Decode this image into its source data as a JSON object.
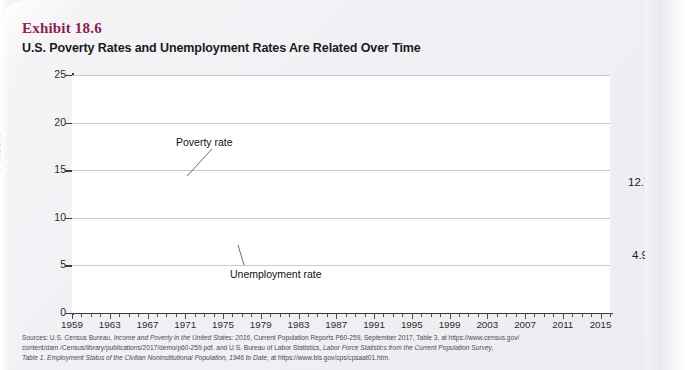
{
  "exhibit": {
    "number": "Exhibit 18.6",
    "title": "U.S. Poverty Rates and Unemployment Rates Are Related Over Time"
  },
  "colors": {
    "poverty_line": "#3b3784",
    "unemployment_line": "#e0201f",
    "exhibit_number": "#8b2252",
    "axis": "#3a3a3a",
    "grid": "#c9c9d2",
    "plot_background": "#ffffff"
  },
  "annotations": {
    "poverty_label": "Poverty rate",
    "unemployment_label": "Unemployment  rate",
    "poverty_end_value": "12.7%",
    "unemployment_end_value": "4.9%"
  },
  "sources": {
    "line1_prefix": "Sources: U.S. Census Bureau, ",
    "line1_italic": "Income and Poverty in the United States: 2016",
    "line1_suffix": ", Current Population Reports P60-259, September 2017, Table 3, at https://www.census.gov/",
    "line2": "content/dam /Census/library/publications/2017/demo/p60-259.pdf. and U.S. Bureau of Labor Statistics, ",
    "line2_italic": "Labor Force Statistics from the Current Population Survey,",
    "line3_italic": "Table 1. Employment Status of the Civilian Noninstitutional Population, 1946 to Date",
    "line3_suffix": ", at https://www.bls.gov/cps/cpsaat01.htm."
  },
  "chart_data": {
    "type": "line",
    "title": "U.S. Poverty Rates and Unemployment Rates Are Related Over Time",
    "xlabel": "",
    "ylabel": "Percent",
    "ylim": [
      0,
      25
    ],
    "yticks": [
      0,
      5,
      10,
      15,
      20,
      25
    ],
    "xlim": [
      1959,
      2016
    ],
    "xticks_labeled": [
      1959,
      1963,
      1967,
      1971,
      1975,
      1979,
      1983,
      1987,
      1991,
      1995,
      1999,
      2003,
      2007,
      2011,
      2015
    ],
    "xtick_interval_minor": 1,
    "grid": "horizontal",
    "legend_position": "inline-annotations",
    "x": [
      1959,
      1960,
      1961,
      1962,
      1963,
      1964,
      1965,
      1966,
      1967,
      1968,
      1969,
      1970,
      1971,
      1972,
      1973,
      1974,
      1975,
      1976,
      1977,
      1978,
      1979,
      1980,
      1981,
      1982,
      1983,
      1984,
      1985,
      1986,
      1987,
      1988,
      1989,
      1990,
      1991,
      1992,
      1993,
      1994,
      1995,
      1996,
      1997,
      1998,
      1999,
      2000,
      2001,
      2002,
      2003,
      2004,
      2005,
      2006,
      2007,
      2008,
      2009,
      2010,
      2011,
      2012,
      2013,
      2014,
      2015,
      2016
    ],
    "series": [
      {
        "name": "Poverty rate",
        "color": "#3b3784",
        "end_label": "12.7%",
        "values": [
          22.4,
          22.2,
          21.9,
          21.0,
          19.5,
          19.0,
          17.3,
          14.7,
          14.2,
          12.8,
          12.1,
          12.6,
          12.5,
          11.9,
          11.1,
          11.2,
          12.3,
          11.8,
          11.6,
          11.4,
          11.7,
          13.0,
          14.0,
          15.0,
          15.2,
          14.4,
          14.0,
          13.6,
          13.4,
          13.0,
          12.8,
          13.5,
          14.2,
          14.8,
          15.1,
          14.5,
          13.8,
          13.7,
          13.3,
          12.7,
          11.9,
          11.3,
          11.7,
          12.1,
          12.5,
          12.7,
          12.6,
          12.3,
          12.5,
          13.2,
          14.3,
          15.1,
          15.0,
          15.0,
          14.8,
          14.8,
          13.5,
          12.7
        ]
      },
      {
        "name": "Unemployment rate",
        "color": "#e0201f",
        "end_label": "4.9%",
        "values": [
          5.5,
          5.5,
          6.7,
          5.5,
          5.7,
          5.2,
          4.5,
          3.8,
          3.8,
          3.6,
          3.5,
          4.9,
          5.9,
          5.6,
          4.9,
          5.6,
          8.5,
          7.7,
          7.1,
          6.1,
          5.8,
          7.1,
          7.6,
          9.7,
          9.6,
          7.5,
          7.2,
          7.0,
          6.2,
          5.5,
          5.3,
          5.6,
          6.8,
          7.5,
          6.9,
          6.1,
          5.6,
          5.4,
          4.9,
          4.5,
          4.2,
          4.0,
          4.7,
          5.8,
          6.0,
          5.5,
          5.1,
          4.6,
          4.6,
          5.8,
          9.3,
          9.6,
          8.9,
          8.1,
          7.4,
          6.2,
          5.3,
          4.9
        ]
      }
    ]
  }
}
